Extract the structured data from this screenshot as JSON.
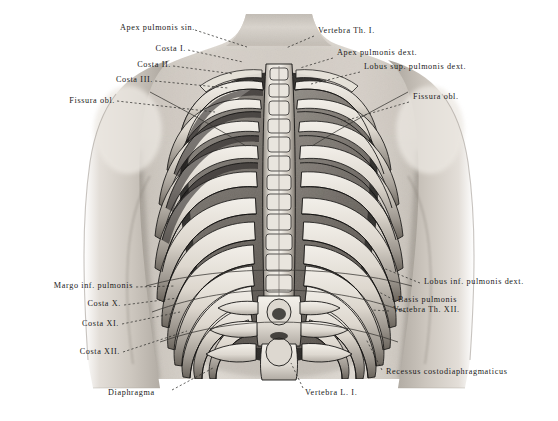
{
  "plate": {
    "title": "Thorax from behind — ribs, vertebral column and lung projections",
    "background_color": "#ffffff",
    "ink_color": "#1a1a1a",
    "width": 558,
    "height": 421
  },
  "labels_left": [
    {
      "id": "apex-pulmonis-sin",
      "text": "Apex pulmonis sin.",
      "x": 103,
      "y": 23,
      "leader": [
        [
          195,
          30
        ],
        [
          247,
          47
        ]
      ]
    },
    {
      "id": "costa-i",
      "text": "Costa I.",
      "x": 144,
      "y": 44,
      "leader": [
        [
          188,
          50
        ],
        [
          243,
          62
        ]
      ]
    },
    {
      "id": "costa-ii",
      "text": "Costa II.",
      "x": 122,
      "y": 60,
      "leader": [
        [
          173,
          66
        ],
        [
          234,
          74
        ]
      ]
    },
    {
      "id": "costa-iii",
      "text": "Costa III.",
      "x": 98,
      "y": 75,
      "leader": [
        [
          155,
          81
        ],
        [
          228,
          88
        ]
      ]
    },
    {
      "id": "fissura-obl-sin",
      "text": "Fissura obl.",
      "x": 55,
      "y": 96,
      "leader": [
        [
          117,
          101
        ],
        [
          215,
          112
        ]
      ]
    },
    {
      "id": "margo-inf-pulmonis",
      "text": "Margo inf. pulmonis",
      "x": 18,
      "y": 283,
      "leader": [
        [
          136,
          287
        ],
        [
          175,
          286
        ]
      ]
    },
    {
      "id": "costa-x",
      "text": "Costa X.",
      "x": 75,
      "y": 301,
      "leader": [
        [
          124,
          305
        ],
        [
          178,
          298
        ]
      ]
    },
    {
      "id": "costa-xi",
      "text": "Costa XI.",
      "x": 68,
      "y": 321,
      "leader": [
        [
          122,
          324
        ],
        [
          180,
          312
        ]
      ]
    },
    {
      "id": "costa-xii",
      "text": "Costa XII.",
      "x": 60,
      "y": 350,
      "leader": [
        [
          123,
          352
        ],
        [
          187,
          331
        ]
      ]
    },
    {
      "id": "diaphragma",
      "text": "Diaphragma",
      "x": 108,
      "y": 392,
      "leader": [
        [
          172,
          390
        ],
        [
          213,
          368
        ]
      ]
    }
  ],
  "labels_right": [
    {
      "id": "vertebra-th-i",
      "text": "Vertebra Th. I.",
      "x": 318,
      "y": 30,
      "leader": [
        [
          314,
          36
        ],
        [
          286,
          48
        ]
      ]
    },
    {
      "id": "apex-pulmonis-dext",
      "text": "Apex pulmonis dext.",
      "x": 337,
      "y": 52,
      "leader": [
        [
          333,
          58
        ],
        [
          300,
          68
        ]
      ]
    },
    {
      "id": "lobus-sup-pulmonis-dext",
      "text": "Lobus sup. pulmonis dext.",
      "x": 364,
      "y": 66,
      "leader": [
        [
          360,
          72
        ],
        [
          311,
          84
        ]
      ]
    },
    {
      "id": "fissura-obl-dext",
      "text": "Fissura obl.",
      "x": 413,
      "y": 96,
      "leader": [
        [
          409,
          102
        ],
        [
          341,
          122
        ]
      ]
    },
    {
      "id": "lobus-inf-pulmonis-dext",
      "text": "Lobus inf. pulmonis dext.",
      "x": 424,
      "y": 281,
      "leader": [
        [
          420,
          283
        ],
        [
          383,
          268
        ]
      ]
    },
    {
      "id": "basis-pulmonis",
      "text": "Basis pulmonis",
      "x": 398,
      "y": 298,
      "leader": [
        [
          394,
          300
        ],
        [
          379,
          292
        ]
      ]
    },
    {
      "id": "vertebra-th-xii",
      "text": "Vertebra Th. XII.",
      "x": 393,
      "y": 309,
      "leader": [
        [
          389,
          311
        ],
        [
          372,
          310
        ]
      ]
    },
    {
      "id": "recessus-costodiaphragmaticus",
      "text": "Recessus costodiaphragmaticus",
      "x": 386,
      "y": 371,
      "leader": [
        [
          382,
          370
        ],
        [
          366,
          339
        ]
      ]
    },
    {
      "id": "vertebra-l-i",
      "text": "Vertebra L. I.",
      "x": 305,
      "y": 392,
      "leader": [
        [
          303,
          388
        ],
        [
          291,
          363
        ]
      ]
    }
  ],
  "figure": {
    "skin_tone_light": "#e8e4df",
    "skin_tone_mid": "#bdb7b0",
    "skin_tone_dark": "#8d8781",
    "bone_light": "#efece6",
    "bone_mid": "#c6c0b7",
    "bone_shadow": "#6d675f",
    "cavity_dark": "#2b2926",
    "lung_tone": "#9a948c",
    "rib_count_visible": 12,
    "outline_color": "#141312"
  }
}
